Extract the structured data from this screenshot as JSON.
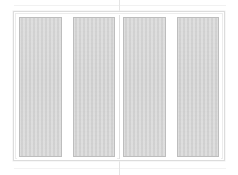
{
  "drawing": {
    "title": "Sliding Window Unit Elevation",
    "view": "front-elevation",
    "background_color": "#ffffff",
    "frame": {
      "label": "Outer Frame",
      "color": "#ffffff",
      "border_color": "#dcdcdc"
    },
    "center_mullion": {
      "label": "Meeting Stile",
      "color": "#ffffff",
      "border_color": "#e0e0e0"
    },
    "construction_lines": {
      "label": "Construction Guides",
      "color": "#e9e9e9",
      "center_vertical": "center-axis",
      "top_horizontal": "top-extension",
      "bottom_horizontal": "bottom-extension"
    },
    "glass": {
      "fill_color": "#d0d0d0",
      "border_color": "#bdbdbd"
    },
    "sashes": [
      {
        "name": "Left Sash",
        "panels": [
          {
            "name": "Panel 1",
            "label": ""
          },
          {
            "name": "Panel 2",
            "label": ""
          }
        ]
      },
      {
        "name": "Right Sash",
        "panels": [
          {
            "name": "Panel 3",
            "label": ""
          },
          {
            "name": "Panel 4",
            "label": ""
          }
        ]
      }
    ]
  }
}
